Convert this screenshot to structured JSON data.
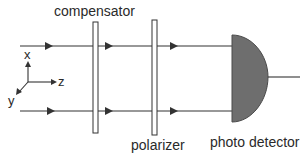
{
  "labels": {
    "compensator": "compensator",
    "polarizer": "polarizer",
    "detector": "photo detector"
  },
  "axes": {
    "x": "x",
    "y": "y",
    "z": "z"
  },
  "colors": {
    "line": "#333333",
    "plate_fill": "#ffffff",
    "detector_fill": "#6e6e6e",
    "text": "#2a2a2a"
  }
}
